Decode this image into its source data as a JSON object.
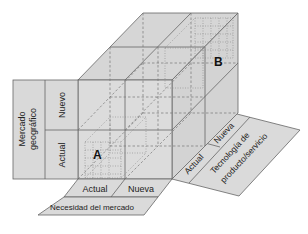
{
  "diagram": {
    "type": "3d-cube-matrix",
    "colors": {
      "face_fill": "#d9d9d9",
      "face_fill_dark": "#cfcfcf",
      "line": "#666666",
      "dashed": "#777777",
      "background": "#ffffff"
    },
    "axes": {
      "vertical": {
        "title_line1": "Mercado",
        "title_line2": "geográfico",
        "levels": {
          "top": "Nuevo",
          "bottom": "Actual"
        }
      },
      "horizontal": {
        "title": "Necesidad del mercado",
        "levels": {
          "left": "Actual",
          "right": "Nueva"
        }
      },
      "depth": {
        "title_line1": "Tecnología de",
        "title_line2": "producto/servicio",
        "levels": {
          "front": "Actual",
          "back": "Nueva"
        }
      }
    },
    "points": {
      "a": {
        "label": "A"
      },
      "b": {
        "label": "B"
      }
    }
  }
}
